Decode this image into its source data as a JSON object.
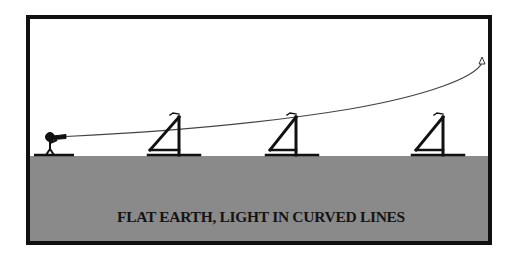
{
  "diagram": {
    "caption": "FLAT EARTH, LIGHT IN CURVED LINES",
    "colors": {
      "frame": "#111111",
      "sky": "#ffffff",
      "ground": "#8a8a8a",
      "line": "#444444",
      "ink": "#111111"
    },
    "elements": {
      "observer": "observer-with-telescope",
      "ships": [
        "ship-1",
        "ship-2",
        "ship-3"
      ],
      "light_path": "curved-line-rising-to-right-with-arrowhead"
    }
  }
}
